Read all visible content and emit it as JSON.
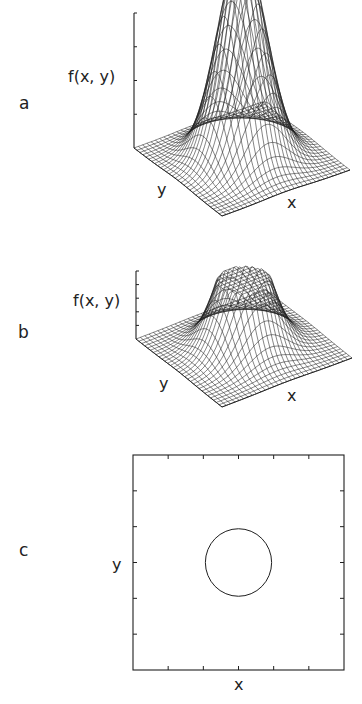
{
  "figure": {
    "panels": [
      {
        "letter": "a",
        "zlabel": "f(x, y)",
        "xlabel": "x",
        "ylabel": "y",
        "description": "3D wireframe of a Gaussian surface"
      },
      {
        "letter": "b",
        "zlabel": "f(x, y)",
        "xlabel": "x",
        "ylabel": "y",
        "description": "3D wireframe of a Gaussian surface truncated (clipped) at a flat top"
      },
      {
        "letter": "c",
        "xlabel": "x",
        "ylabel": "y",
        "description": "2D plot showing circular contour where the clipping occurs"
      }
    ]
  },
  "chart_data": [
    {
      "type": "surface",
      "panel": "a",
      "title": "",
      "xlabel": "x",
      "ylabel": "y",
      "zlabel": "f(x, y)",
      "function": "gaussian",
      "center": [
        0.5,
        0.5
      ],
      "sigma": 0.16,
      "grid_lines": 30,
      "z_ticks": 4,
      "clip_level": null
    },
    {
      "type": "surface",
      "panel": "b",
      "title": "",
      "xlabel": "x",
      "ylabel": "y",
      "zlabel": "f(x, y)",
      "function": "gaussian_clipped",
      "center": [
        0.5,
        0.5
      ],
      "sigma": 0.16,
      "grid_lines": 30,
      "z_ticks": 5,
      "clip_level": 0.55
    },
    {
      "type": "contour",
      "panel": "c",
      "title": "",
      "xlabel": "x",
      "ylabel": "y",
      "xlim": [
        0,
        1
      ],
      "ylim": [
        0,
        1
      ],
      "ticks_per_side": 5,
      "circle": {
        "cx": 0.5,
        "cy": 0.5,
        "r": 0.157
      }
    }
  ],
  "colors": {
    "line": "#1f1f1f",
    "background": "#ffffff"
  }
}
